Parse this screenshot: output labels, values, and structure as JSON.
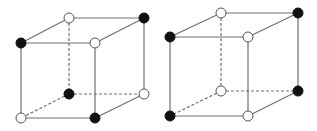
{
  "diagram": {
    "title": "",
    "colors": {
      "edge": "#707070",
      "filled_vertex": "#111111",
      "open_vertex_fill": "#ffffff",
      "open_vertex_stroke": "#555555",
      "background": "#ffffff"
    },
    "vertex_radius": 5,
    "cubes": [
      {
        "id": "cube-left",
        "vertices": {
          "front_top_left": {
            "x": 21,
            "y": 43,
            "state": "filled"
          },
          "front_top_right": {
            "x": 95,
            "y": 43,
            "state": "open"
          },
          "front_bottom_left": {
            "x": 21,
            "y": 118,
            "state": "open"
          },
          "front_bottom_right": {
            "x": 95,
            "y": 118,
            "state": "filled"
          },
          "back_top_left": {
            "x": 69,
            "y": 18,
            "state": "open"
          },
          "back_top_right": {
            "x": 144,
            "y": 18,
            "state": "filled"
          },
          "back_bottom_left": {
            "x": 69,
            "y": 94,
            "state": "filled"
          },
          "back_bottom_right": {
            "x": 144,
            "y": 94,
            "state": "open"
          }
        }
      },
      {
        "id": "cube-right",
        "vertices": {
          "front_top_left": {
            "x": 170,
            "y": 37,
            "state": "filled"
          },
          "front_top_right": {
            "x": 248,
            "y": 37,
            "state": "open"
          },
          "front_bottom_left": {
            "x": 170,
            "y": 116,
            "state": "filled"
          },
          "front_bottom_right": {
            "x": 248,
            "y": 116,
            "state": "open"
          },
          "back_top_left": {
            "x": 221,
            "y": 13,
            "state": "open"
          },
          "back_top_right": {
            "x": 298,
            "y": 13,
            "state": "filled"
          },
          "back_bottom_left": {
            "x": 221,
            "y": 91,
            "state": "open"
          },
          "back_bottom_right": {
            "x": 298,
            "y": 91,
            "state": "filled"
          }
        }
      }
    ],
    "edges": [
      {
        "from": "front_top_left",
        "to": "front_top_right",
        "style": "solid"
      },
      {
        "from": "front_top_right",
        "to": "front_bottom_right",
        "style": "solid"
      },
      {
        "from": "front_bottom_right",
        "to": "front_bottom_left",
        "style": "solid"
      },
      {
        "from": "front_bottom_left",
        "to": "front_top_left",
        "style": "solid"
      },
      {
        "from": "back_top_left",
        "to": "back_top_right",
        "style": "solid"
      },
      {
        "from": "back_top_right",
        "to": "back_bottom_right",
        "style": "solid"
      },
      {
        "from": "front_top_left",
        "to": "back_top_left",
        "style": "solid"
      },
      {
        "from": "front_top_right",
        "to": "back_top_right",
        "style": "solid"
      },
      {
        "from": "front_bottom_right",
        "to": "back_bottom_right",
        "style": "solid"
      },
      {
        "from": "back_top_left",
        "to": "back_bottom_left",
        "style": "dashed"
      },
      {
        "from": "back_bottom_left",
        "to": "back_bottom_right",
        "style": "dashed"
      },
      {
        "from": "back_bottom_left",
        "to": "front_bottom_left",
        "style": "dashed"
      }
    ]
  }
}
